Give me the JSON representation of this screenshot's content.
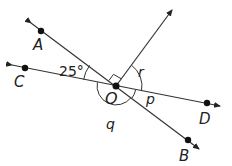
{
  "diagram": {
    "center": {
      "label": "O",
      "x": 116,
      "y": 86
    },
    "points": [
      {
        "label": "A",
        "x": 41,
        "y": 31,
        "lx": 33,
        "ly": 50
      },
      {
        "label": "C",
        "x": 25,
        "y": 68,
        "lx": 14,
        "ly": 86
      },
      {
        "label": "D",
        "x": 207,
        "y": 103,
        "lx": 199,
        "ly": 123
      },
      {
        "label": "B",
        "x": 188,
        "y": 140,
        "lx": 179,
        "ly": 160
      }
    ],
    "angle_labels": {
      "given": "25°",
      "r": "r",
      "p": "p",
      "q": "q"
    },
    "colors": {
      "line": "#333333",
      "point": "#111111"
    }
  }
}
